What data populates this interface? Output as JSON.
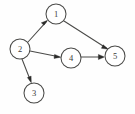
{
  "figure": {
    "background_color": "#fefefe",
    "node_fill": "#ffffff",
    "node_stroke": "#4a4a48",
    "edge_color": "#4a4a48",
    "arrowhead_color": "#2c2c2a",
    "width": 135,
    "height": 114
  },
  "graph": {
    "type": "directed",
    "node_radius": 10,
    "nodes": [
      {
        "id": "1",
        "label": "1",
        "cx": 56,
        "cy": 14,
        "r": 10
      },
      {
        "id": "2",
        "label": "2",
        "cx": 20,
        "cy": 49,
        "r": 10
      },
      {
        "id": "3",
        "label": "3",
        "cx": 34,
        "cy": 93,
        "r": 10
      },
      {
        "id": "4",
        "label": "4",
        "cx": 71,
        "cy": 58,
        "r": 10
      },
      {
        "id": "5",
        "label": "5",
        "cx": 115,
        "cy": 56,
        "r": 10
      }
    ],
    "edges": [
      {
        "id": "e-2-1",
        "from": "2",
        "to": "1",
        "label": "",
        "x1": 28,
        "y1": 42,
        "x2": 47,
        "y2": 21,
        "directed": true
      },
      {
        "id": "e-2-3",
        "from": "2",
        "to": "3",
        "label": "",
        "x1": 22,
        "y1": 59,
        "x2": 31,
        "y2": 82,
        "directed": true
      },
      {
        "id": "e-2-4",
        "from": "2",
        "to": "4",
        "label": "",
        "x1": 30,
        "y1": 51,
        "x2": 60,
        "y2": 57,
        "directed": true
      },
      {
        "id": "e-1-5",
        "from": "1",
        "to": "5",
        "label": "",
        "x1": 64,
        "y1": 21,
        "x2": 108,
        "y2": 49,
        "directed": true
      },
      {
        "id": "e-4-5",
        "from": "4",
        "to": "5",
        "label": "",
        "x1": 81,
        "y1": 57,
        "x2": 104,
        "y2": 57,
        "directed": true
      }
    ]
  }
}
